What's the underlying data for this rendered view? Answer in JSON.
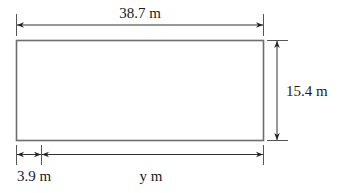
{
  "diagram": {
    "type": "rectangle-dimension-drawing",
    "rectangle": {
      "width_label": "38.7 m",
      "height_label": "15.4 m"
    },
    "bottom_segments": [
      {
        "label": "3.9 m"
      },
      {
        "label": "y m"
      }
    ],
    "colors": {
      "rectangle_stroke": "#6e6e6e",
      "dimension_lines": "#444444",
      "text": "#1a1a1a"
    }
  }
}
